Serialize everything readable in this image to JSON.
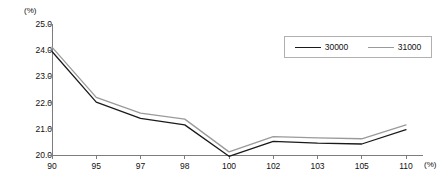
{
  "chart_data": {
    "type": "line",
    "title": "",
    "subtitle": "",
    "xlabel": "(%)",
    "ylabel": "(%)",
    "x_unit_label": "(%)",
    "y_unit_label": "(%)",
    "categories": [
      "90",
      "95",
      "97",
      "98",
      "100",
      "102",
      "103",
      "105",
      "110"
    ],
    "xtick_labels": [
      "90",
      "95",
      "97",
      "98",
      "100",
      "102",
      "103",
      "105",
      "110"
    ],
    "ytick_labels": [
      "25.0",
      "24.0",
      "23.0",
      "22.0",
      "21.0",
      "20.0"
    ],
    "ytick_values": [
      25.0,
      24.0,
      23.0,
      22.0,
      21.0,
      20.0
    ],
    "ylim": [
      20.0,
      25.0
    ],
    "grid": false,
    "legend_position": "top-right",
    "series": [
      {
        "name": "30000",
        "color": "#1a1a1a",
        "values": [
          23.95,
          22.02,
          21.4,
          21.15,
          19.95,
          20.52,
          20.45,
          20.42,
          20.97
        ]
      },
      {
        "name": "31000",
        "color": "#9a9a9a",
        "values": [
          24.12,
          22.2,
          21.6,
          21.37,
          20.12,
          20.7,
          20.65,
          20.62,
          21.15
        ]
      }
    ]
  }
}
